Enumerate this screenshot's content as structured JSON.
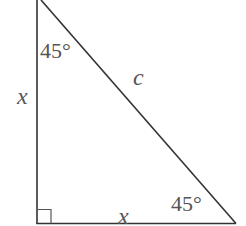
{
  "diagram": {
    "type": "right-isosceles-triangle",
    "labels": {
      "top_angle": "45°",
      "bottom_right_angle": "45°",
      "left_side": "x",
      "bottom_side": "x",
      "hypotenuse": "c"
    },
    "right_angle_marker": true,
    "colors": {
      "stroke": "#333333",
      "text": "#555555",
      "background": "#ffffff"
    }
  }
}
